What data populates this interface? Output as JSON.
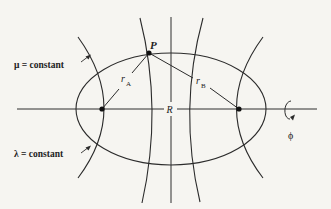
{
  "diagram": {
    "labels": {
      "mu_constant": "μ = constant",
      "lambda_constant": "λ = constant",
      "point_p": "P",
      "r_a_main": "r",
      "r_a_sub": "A",
      "r_b_main": "r",
      "r_b_sub": "B",
      "internuclear": "R",
      "phi": "ϕ"
    },
    "nodes": [
      {
        "id": "A",
        "label": "nucleus A",
        "x": 102,
        "y": 109
      },
      {
        "id": "B",
        "label": "nucleus B",
        "x": 239,
        "y": 109
      },
      {
        "id": "P",
        "label": "P",
        "x": 149,
        "y": 53
      }
    ],
    "edges": [
      {
        "from": "A",
        "to": "P",
        "label": "rA"
      },
      {
        "from": "B",
        "to": "P",
        "label": "rB"
      },
      {
        "from": "A",
        "to": "B",
        "label": "R"
      }
    ],
    "curves": {
      "ellipse": {
        "family": "lambda = constant",
        "cx": 171,
        "cy": 109,
        "rx": 95,
        "ry": 56
      },
      "hyperbolas": [
        {
          "family": "mu = constant",
          "side": "left-outer"
        },
        {
          "family": "mu = constant",
          "side": "left-inner"
        },
        {
          "family": "mu = constant",
          "side": "right-inner"
        },
        {
          "family": "mu = constant",
          "side": "right-outer"
        }
      ],
      "perpendicular_bisector": {
        "x": 171
      }
    },
    "colors": {
      "background": "#f6f5f1",
      "ink": "#2b2b2b"
    }
  }
}
